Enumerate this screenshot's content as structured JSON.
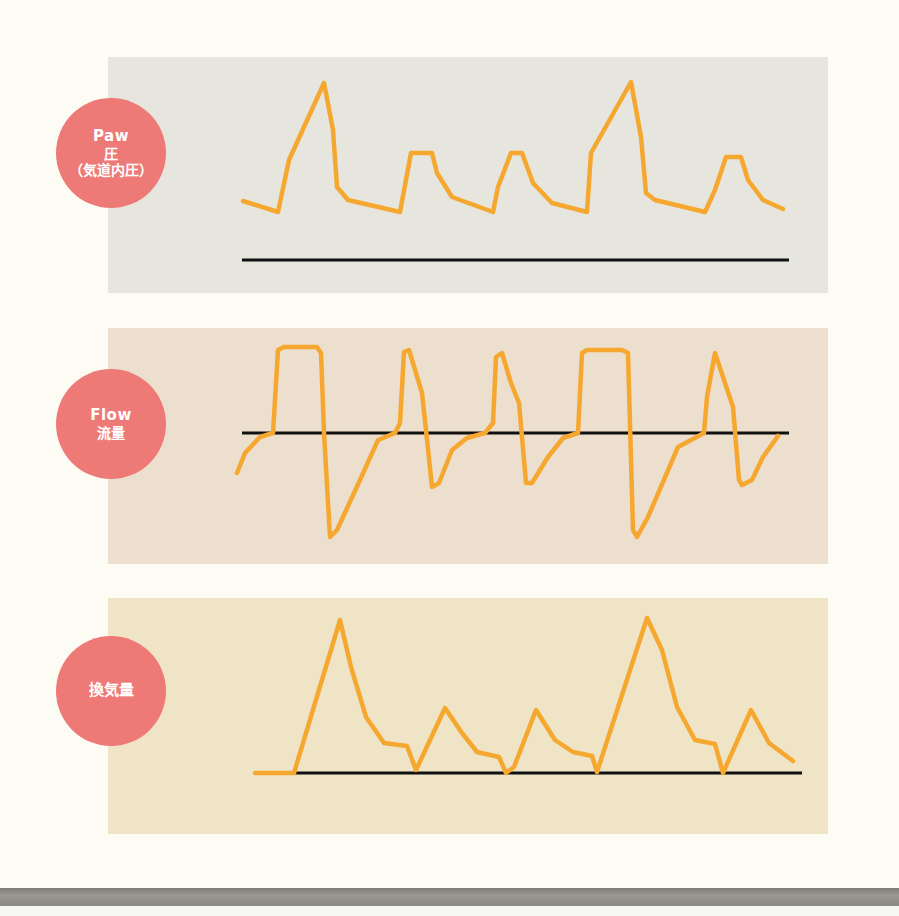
{
  "labels": {
    "paw": {
      "en": "Paw",
      "jp1": "圧",
      "jp2": "（気道内圧）"
    },
    "flow": {
      "en": "Flow",
      "jp1": "流量"
    },
    "volume": {
      "jp1": "換気量"
    }
  },
  "colors": {
    "waveform": "#f5a72f",
    "baseline": "#111111",
    "label_circle": "#ee7a78",
    "panel_paw": "#e6e6de",
    "panel_flow": "#ecdfcd",
    "panel_volume": "#efe5c6",
    "page_background": "#fdfcf4"
  },
  "chart_data": [
    {
      "type": "line",
      "title": "Paw 圧（気道内圧）",
      "description": "Airway pressure waveform: two large mandatory breaths (tall peaks) and three smaller plateau-shaped spontaneous/support breaths",
      "baseline_y": 260,
      "points": [
        [
          243,
          201
        ],
        [
          278,
          212
        ],
        [
          289,
          160
        ],
        [
          324,
          83
        ],
        [
          333,
          130
        ],
        [
          337,
          187
        ],
        [
          348,
          200
        ],
        [
          400,
          212
        ],
        [
          411,
          153
        ],
        [
          432,
          153
        ],
        [
          437,
          173
        ],
        [
          452,
          197
        ],
        [
          493,
          212
        ],
        [
          498,
          187
        ],
        [
          511,
          153
        ],
        [
          522,
          153
        ],
        [
          533,
          183
        ],
        [
          552,
          203
        ],
        [
          587,
          212
        ],
        [
          591,
          153
        ],
        [
          631,
          82
        ],
        [
          641,
          137
        ],
        [
          646,
          193
        ],
        [
          655,
          200
        ],
        [
          705,
          212
        ],
        [
          715,
          190
        ],
        [
          726,
          157
        ],
        [
          741,
          157
        ],
        [
          748,
          180
        ],
        [
          763,
          200
        ],
        [
          783,
          209
        ]
      ],
      "baseline": [
        [
          242,
          260
        ],
        [
          789,
          260
        ]
      ]
    },
    {
      "type": "line",
      "title": "Flow 流量",
      "description": "Flow waveform: square inspiratory flow for mandatory breaths, decelerating peaks for spontaneous breaths, negative expiratory deflections",
      "baseline_y": 433,
      "points": [
        [
          237,
          473
        ],
        [
          245,
          453
        ],
        [
          260,
          437
        ],
        [
          273,
          433
        ],
        [
          278,
          350
        ],
        [
          284,
          347
        ],
        [
          317,
          347
        ],
        [
          321,
          353
        ],
        [
          324,
          433
        ],
        [
          330,
          537
        ],
        [
          337,
          530
        ],
        [
          360,
          480
        ],
        [
          378,
          440
        ],
        [
          395,
          433
        ],
        [
          400,
          423
        ],
        [
          404,
          352
        ],
        [
          409,
          350
        ],
        [
          422,
          393
        ],
        [
          426,
          430
        ],
        [
          432,
          487
        ],
        [
          439,
          483
        ],
        [
          452,
          450
        ],
        [
          467,
          438
        ],
        [
          485,
          433
        ],
        [
          493,
          423
        ],
        [
          496,
          357
        ],
        [
          502,
          353
        ],
        [
          511,
          383
        ],
        [
          519,
          403
        ],
        [
          522,
          437
        ],
        [
          526,
          483
        ],
        [
          532,
          483
        ],
        [
          548,
          457
        ],
        [
          563,
          438
        ],
        [
          578,
          433
        ],
        [
          582,
          353
        ],
        [
          587,
          350
        ],
        [
          622,
          350
        ],
        [
          628,
          353
        ],
        [
          633,
          530
        ],
        [
          637,
          537
        ],
        [
          648,
          517
        ],
        [
          678,
          447
        ],
        [
          704,
          433
        ],
        [
          707,
          397
        ],
        [
          715,
          353
        ],
        [
          733,
          407
        ],
        [
          739,
          480
        ],
        [
          742,
          485
        ],
        [
          752,
          480
        ],
        [
          763,
          457
        ],
        [
          778,
          436
        ]
      ],
      "baseline": [
        [
          242,
          433
        ],
        [
          789,
          433
        ]
      ]
    },
    {
      "type": "line",
      "title": "換気量",
      "description": "Tidal volume waveform: two large triangular volume peaks and three smaller peaks",
      "baseline_y": 773,
      "points": [
        [
          255,
          773
        ],
        [
          294,
          773
        ],
        [
          340,
          620
        ],
        [
          351,
          667
        ],
        [
          366,
          717
        ],
        [
          384,
          743
        ],
        [
          407,
          746
        ],
        [
          416,
          770
        ],
        [
          445,
          708
        ],
        [
          462,
          733
        ],
        [
          477,
          752
        ],
        [
          499,
          757
        ],
        [
          506,
          773
        ],
        [
          514,
          767
        ],
        [
          536,
          710
        ],
        [
          555,
          740
        ],
        [
          573,
          752
        ],
        [
          592,
          756
        ],
        [
          597,
          772
        ],
        [
          647,
          618
        ],
        [
          662,
          650
        ],
        [
          677,
          707
        ],
        [
          695,
          740
        ],
        [
          715,
          744
        ],
        [
          723,
          773
        ],
        [
          751,
          710
        ],
        [
          769,
          743
        ],
        [
          793,
          761
        ]
      ],
      "baseline": [
        [
          294,
          773
        ],
        [
          802,
          773
        ]
      ]
    }
  ]
}
